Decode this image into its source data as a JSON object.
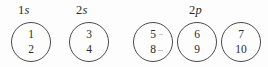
{
  "figure": {
    "background_color": "#fdfdfd",
    "line_color": "#4a4a4a",
    "text_color": "#2b2b2b"
  },
  "groups": [
    {
      "shell": "1",
      "subshell": "s",
      "label": "1s"
    },
    {
      "shell": "2",
      "subshell": "s",
      "label": "2s"
    },
    {
      "shell": "2",
      "subshell": "p",
      "label": "2p"
    }
  ],
  "orbitals": [
    {
      "group": "1s",
      "top_electron": "1",
      "bottom_electron": "2"
    },
    {
      "group": "2s",
      "top_electron": "3",
      "bottom_electron": "4"
    },
    {
      "group": "2p",
      "top_electron": "5",
      "bottom_electron": "8"
    },
    {
      "group": "2p",
      "top_electron": "6",
      "bottom_electron": "9"
    },
    {
      "group": "2p",
      "top_electron": "7",
      "bottom_electron": "10"
    }
  ]
}
